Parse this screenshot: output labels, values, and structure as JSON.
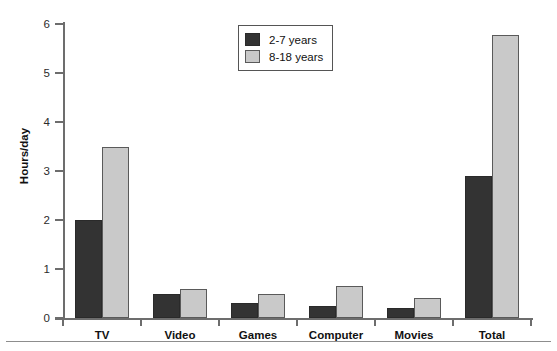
{
  "chart_data": {
    "type": "bar",
    "title": "",
    "xlabel": "",
    "ylabel": "Hours/day",
    "ylim": [
      0,
      6
    ],
    "yticks": [
      0,
      1,
      2,
      3,
      4,
      5,
      6
    ],
    "ytick_labels": [
      "0",
      "1",
      "2",
      "3",
      "4",
      "5",
      "6"
    ],
    "grid": false,
    "legend_position": "top-center",
    "categories": [
      "TV",
      "Video",
      "Games",
      "Computer",
      "Movies",
      "Total"
    ],
    "series": [
      {
        "name": "2-7 years",
        "color": "#333333",
        "values": [
          2.0,
          0.5,
          0.3,
          0.25,
          0.2,
          2.9
        ]
      },
      {
        "name": "8-18 years",
        "color": "#c9c9c9",
        "values": [
          3.5,
          0.6,
          0.5,
          0.65,
          0.4,
          5.78
        ]
      }
    ]
  },
  "axis": {
    "y_title": "Hours/day",
    "y_labels": [
      "6",
      "5",
      "4",
      "3",
      "2",
      "1",
      "0"
    ],
    "x_labels": [
      "TV",
      "Video",
      "Games",
      "Computer",
      "Movies",
      "Total"
    ]
  },
  "legend": {
    "entries": [
      {
        "label": "2-7 years"
      },
      {
        "label": "8-18 years"
      }
    ]
  },
  "colors": {
    "series_0": "#333333",
    "series_1": "#c9c9c9",
    "axis": "#6d6d6d",
    "text": "#111111",
    "background": "#ffffff"
  }
}
